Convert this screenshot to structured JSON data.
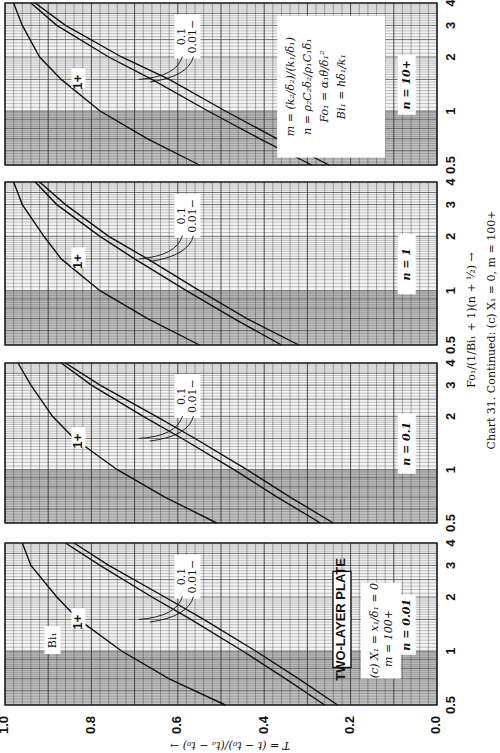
{
  "chart_data": {
    "type": "line",
    "caption_prefix": "Chart 31.",
    "caption_rest": "Continued: (c)  X₁ = 0,  m = 100+",
    "orientation": "rotated 90 degrees clockwise (page turned)",
    "xlabel": "Fo₁/(1/Bi₁ + 1)(n + ½)",
    "ylabel": "T = (t − t₀)/(tₐ − t₀)",
    "xscale": "log",
    "xlim": [
      0.5,
      4
    ],
    "x_ticks": [
      "0.5",
      "1",
      "2",
      "3",
      "4"
    ],
    "ylim": [
      0.0,
      1.0
    ],
    "y_ticks": [
      "1.0",
      "0.8",
      "0.6",
      "0.4",
      "0.2",
      "0.0"
    ],
    "grid": true,
    "shaded_band": "x from 0.5 to 1 (darker grey)",
    "title_box": "TWO-LAYER PLATE",
    "condition_box": [
      "(c)",
      "X₁ = x₁/δ₁ = 0",
      "m = 100+"
    ],
    "bi_label": "Bi₁",
    "definitions": [
      "m = (k₂/δ₂)/(k₁/δ₁)",
      "n = ρ₂C₂δ₂/ρ₁C₁δ₁",
      "Fo₁ = α₁θ/δ₁²",
      "Bi₁ = hδ₁/k₁"
    ],
    "panels": [
      {
        "n_label": "n = 0.01",
        "series": [
          {
            "name": "1+",
            "x": [
              0.5,
              0.7,
              1.0,
              1.5,
              2.0,
              3.0,
              4.0
            ],
            "y": [
              0.49,
              0.62,
              0.73,
              0.83,
              0.88,
              0.94,
              0.96
            ]
          },
          {
            "name": "0.1",
            "x": [
              0.5,
              0.7,
              1.0,
              1.5,
              2.0,
              3.0,
              4.0
            ],
            "y": [
              0.26,
              0.35,
              0.45,
              0.57,
              0.66,
              0.78,
              0.86
            ]
          },
          {
            "name": "0.01−",
            "x": [
              0.5,
              0.7,
              1.0,
              1.5,
              2.0,
              3.0,
              4.0
            ],
            "y": [
              0.23,
              0.32,
              0.42,
              0.54,
              0.63,
              0.76,
              0.84
            ]
          }
        ]
      },
      {
        "n_label": "n = 0.1",
        "series": [
          {
            "name": "1+",
            "x": [
              0.5,
              0.7,
              1.0,
              1.5,
              2.0,
              3.0,
              4.0
            ],
            "y": [
              0.51,
              0.63,
              0.74,
              0.84,
              0.89,
              0.94,
              0.97
            ]
          },
          {
            "name": "0.1",
            "x": [
              0.5,
              0.7,
              1.0,
              1.5,
              2.0,
              3.0,
              4.0
            ],
            "y": [
              0.27,
              0.37,
              0.47,
              0.59,
              0.68,
              0.8,
              0.87
            ]
          },
          {
            "name": "0.01−",
            "x": [
              0.5,
              0.7,
              1.0,
              1.5,
              2.0,
              3.0,
              4.0
            ],
            "y": [
              0.24,
              0.34,
              0.44,
              0.56,
              0.65,
              0.78,
              0.86
            ]
          }
        ]
      },
      {
        "n_label": "n = 1",
        "series": [
          {
            "name": "1+",
            "x": [
              0.5,
              0.7,
              1.0,
              1.5,
              2.0,
              3.0,
              4.0
            ],
            "y": [
              0.55,
              0.67,
              0.78,
              0.87,
              0.91,
              0.96,
              0.98
            ]
          },
          {
            "name": "0.1",
            "x": [
              0.5,
              0.7,
              1.0,
              1.5,
              2.0,
              3.0,
              4.0
            ],
            "y": [
              0.36,
              0.47,
              0.58,
              0.7,
              0.78,
              0.88,
              0.93
            ]
          },
          {
            "name": "0.01−",
            "x": [
              0.5,
              0.7,
              1.0,
              1.5,
              2.0,
              3.0,
              4.0
            ],
            "y": [
              0.32,
              0.44,
              0.55,
              0.67,
              0.76,
              0.86,
              0.92
            ]
          }
        ]
      },
      {
        "n_label": "n = 10+",
        "series": [
          {
            "name": "1+",
            "x": [
              0.5,
              0.7,
              1.0,
              1.5,
              2.0,
              3.0,
              4.0
            ],
            "y": [
              0.55,
              0.67,
              0.78,
              0.87,
              0.92,
              0.96,
              0.98
            ]
          },
          {
            "name": "0.1",
            "x": [
              0.5,
              0.7,
              1.0,
              1.5,
              2.0,
              3.0,
              4.0
            ],
            "y": [
              0.29,
              0.41,
              0.53,
              0.66,
              0.76,
              0.88,
              0.94
            ]
          },
          {
            "name": "0.01−",
            "x": [
              0.5,
              0.7,
              1.0,
              1.5,
              2.0,
              3.0,
              4.0
            ],
            "y": [
              0.25,
              0.37,
              0.49,
              0.62,
              0.73,
              0.86,
              0.93
            ]
          }
        ]
      }
    ]
  },
  "colors": {
    "grid": "#3a3a3a",
    "shade": "#9a9a9a",
    "line": "#111111",
    "paper": "#ffffff"
  }
}
